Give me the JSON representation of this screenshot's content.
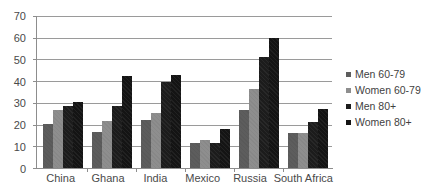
{
  "chart_data": {
    "type": "bar",
    "title": "",
    "subtitle": "",
    "xlabel": "",
    "ylabel": "",
    "ylim": [
      0,
      70
    ],
    "ytick_step": 10,
    "yticks": [
      0,
      10,
      20,
      30,
      40,
      50,
      60,
      70
    ],
    "grid": true,
    "legend_position": "right",
    "categories": [
      "China",
      "Ghana",
      "India",
      "Mexico",
      "Russia",
      "South Africa"
    ],
    "series": [
      {
        "name": "Men 60-79",
        "color": "#5d5d5d",
        "values": [
          20.5,
          16.5,
          22.0,
          11.5,
          26.5,
          16.0
        ]
      },
      {
        "name": "Women 60-79",
        "color": "#8e8e8e",
        "values": [
          26.5,
          21.8,
          25.5,
          13.0,
          36.6,
          16.3
        ]
      },
      {
        "name": "Men 80+",
        "color": "#1c1c1c",
        "values": [
          28.6,
          28.6,
          39.5,
          11.5,
          51.2,
          21.3
        ]
      },
      {
        "name": "Women 80+",
        "color": "#141414",
        "values": [
          30.6,
          42.2,
          43.0,
          18.0,
          59.8,
          27.3
        ]
      }
    ]
  },
  "axis": {
    "y_tick_labels": [
      "70",
      "60",
      "50",
      "40",
      "30",
      "20",
      "10",
      "0"
    ]
  },
  "legend": {
    "items": [
      {
        "label": "Men 60-79"
      },
      {
        "label": "Women 60-79"
      },
      {
        "label": "Men 80+"
      },
      {
        "label": "Women 80+"
      }
    ]
  }
}
